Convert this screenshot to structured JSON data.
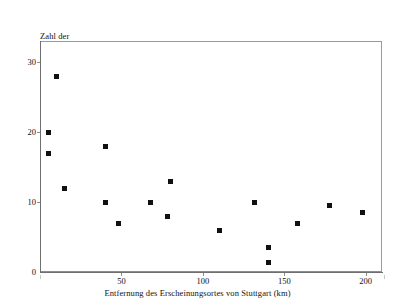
{
  "chart_data": {
    "type": "scatter",
    "title": "",
    "ylabel": "Zahl der Übernahmen",
    "ylabel_lines": [
      "Zahl der",
      "Übernahmen"
    ],
    "xlabel": "Entfernung des Erscheinungsortes von Stuttgart (km)",
    "xlim": [
      0,
      210
    ],
    "ylim": [
      0,
      33
    ],
    "xticks": [
      50,
      100,
      150,
      200
    ],
    "xtick_labels": [
      "50",
      "100",
      "150",
      "200"
    ],
    "yticks": [
      0,
      10,
      20,
      30
    ],
    "ytick_labels": [
      "0",
      "10",
      "20",
      "30"
    ],
    "grid": false,
    "legend": null,
    "marker": "square",
    "marker_color": "#111111",
    "frame_color": "#8d8d8d",
    "points": [
      {
        "x": 5,
        "y": 20.0
      },
      {
        "x": 5,
        "y": 17.0
      },
      {
        "x": 10,
        "y": 28.0
      },
      {
        "x": 15,
        "y": 12.0
      },
      {
        "x": 40,
        "y": 18.0
      },
      {
        "x": 40,
        "y": 10.0
      },
      {
        "x": 48,
        "y": 7.0
      },
      {
        "x": 68,
        "y": 10.0
      },
      {
        "x": 78,
        "y": 8.0
      },
      {
        "x": 80,
        "y": 13.0
      },
      {
        "x": 110,
        "y": 6.0
      },
      {
        "x": 132,
        "y": 10.0
      },
      {
        "x": 140,
        "y": 3.5
      },
      {
        "x": 140,
        "y": 1.3
      },
      {
        "x": 158,
        "y": 7.0
      },
      {
        "x": 178,
        "y": 9.5
      },
      {
        "x": 198,
        "y": 8.5
      }
    ]
  }
}
